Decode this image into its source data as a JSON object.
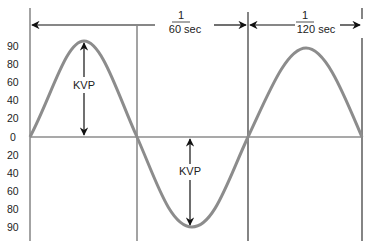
{
  "diagram": {
    "title": "",
    "y_axis_labels_top": [
      "90",
      "80",
      "60",
      "40",
      "20",
      "0"
    ],
    "y_axis_labels_bottom": [
      "20",
      "40",
      "60",
      "80",
      "90"
    ],
    "period_label": {
      "numerator": "1",
      "denominator_unit": "60 sec"
    },
    "half_period_label": {
      "numerator": "1",
      "denominator_unit": "120 sec"
    },
    "peak_label_positive": "KVP",
    "peak_label_negative": "KVP",
    "colors": {
      "wave": "#8c8c8c",
      "axis": "#8c8c8c",
      "arrow": "#111111",
      "text": "#222222"
    }
  }
}
